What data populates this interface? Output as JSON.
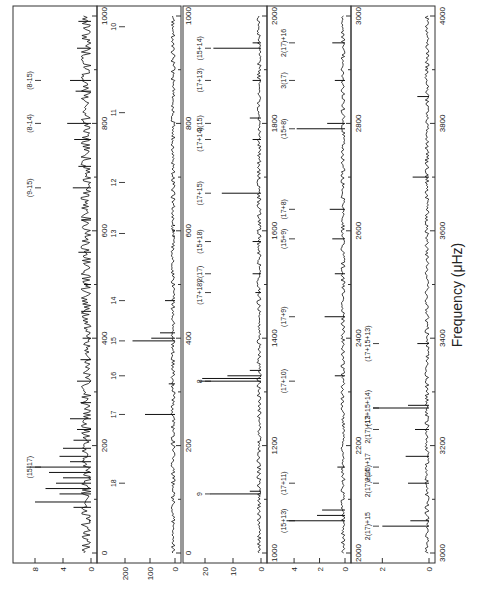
{
  "chart_data": {
    "type": "line",
    "orientation": "rotated-90-ccw",
    "xlabel": "Frequency (μHz)",
    "panels": [
      {
        "id": "p1",
        "xlim": [
          0,
          1000
        ],
        "xticks": [
          0,
          200,
          400,
          600,
          800,
          1000
        ],
        "ylim": [
          0,
          10
        ],
        "yticks": [
          0,
          4,
          8
        ],
        "peaks": [
          {
            "x": 60,
            "y": 0.3
          },
          {
            "x": 85,
            "y": 2.5
          },
          {
            "x": 95,
            "y": 8.0
          },
          {
            "x": 110,
            "y": 4.5
          },
          {
            "x": 120,
            "y": 6.5
          },
          {
            "x": 130,
            "y": 5.0
          },
          {
            "x": 140,
            "y": 4.0
          },
          {
            "x": 150,
            "y": 6.0
          },
          {
            "x": 160,
            "y": 9.2
          },
          {
            "x": 170,
            "y": 3.0
          },
          {
            "x": 180,
            "y": 4.5
          },
          {
            "x": 195,
            "y": 4.0
          },
          {
            "x": 210,
            "y": 2.5
          },
          {
            "x": 230,
            "y": 2.0
          },
          {
            "x": 250,
            "y": 3.0
          },
          {
            "x": 280,
            "y": 1.5
          },
          {
            "x": 320,
            "y": 2.0
          },
          {
            "x": 360,
            "y": 1.5
          },
          {
            "x": 400,
            "y": 1.2
          },
          {
            "x": 450,
            "y": 1.4
          },
          {
            "x": 500,
            "y": 1.0
          },
          {
            "x": 560,
            "y": 1.8
          },
          {
            "x": 620,
            "y": 1.4
          },
          {
            "x": 680,
            "y": 2.6
          },
          {
            "x": 720,
            "y": 1.8
          },
          {
            "x": 770,
            "y": 2.4
          },
          {
            "x": 800,
            "y": 3.4
          },
          {
            "x": 860,
            "y": 2.2
          },
          {
            "x": 880,
            "y": 3.0
          },
          {
            "x": 940,
            "y": 2.0
          },
          {
            "x": 990,
            "y": 1.8
          }
        ],
        "annotations": [
          {
            "label": "(15-17)",
            "x": 160,
            "style": "side"
          },
          {
            "label": "(9-15)",
            "x": 680
          },
          {
            "label": "(8-14)",
            "x": 800
          },
          {
            "label": "(8-15)",
            "x": 880
          }
        ]
      },
      {
        "id": "p2",
        "xlim": [
          0,
          1000
        ],
        "xticks": [
          0,
          200,
          400,
          600,
          800,
          1000
        ],
        "ylim": [
          0,
          280
        ],
        "yticks": [
          0,
          100,
          200
        ],
        "peaks": [
          {
            "x": 258,
            "y": 120
          },
          {
            "x": 315,
            "y": 25
          },
          {
            "x": 395,
            "y": 170
          },
          {
            "x": 400,
            "y": 95
          },
          {
            "x": 410,
            "y": 60
          },
          {
            "x": 470,
            "y": 40
          },
          {
            "x": 590,
            "y": 10
          },
          {
            "x": 600,
            "y": 12
          },
          {
            "x": 610,
            "y": 8
          }
        ],
        "annotations": [
          {
            "label": "18",
            "x": 130
          },
          {
            "label": "17",
            "x": 258
          },
          {
            "label": "16",
            "x": 330
          },
          {
            "label": "15",
            "x": 395
          },
          {
            "label": "14",
            "x": 470
          },
          {
            "label": "13",
            "x": 595
          },
          {
            "label": "12",
            "x": 690
          },
          {
            "label": "11",
            "x": 820
          },
          {
            "label": "10",
            "x": 980
          }
        ]
      },
      {
        "id": "p3",
        "xlim": [
          1000,
          2000
        ],
        "xticks": [
          1000,
          1200,
          1400,
          1600,
          1800,
          2000
        ],
        "ylim": [
          0,
          25
        ],
        "yticks": [
          0,
          10,
          20
        ],
        "peaks": [
          {
            "x": 1110,
            "y": 18
          },
          {
            "x": 1115,
            "y": 4
          },
          {
            "x": 1320,
            "y": 22
          },
          {
            "x": 1325,
            "y": 21
          },
          {
            "x": 1330,
            "y": 12
          },
          {
            "x": 1340,
            "y": 4
          },
          {
            "x": 1485,
            "y": 2
          },
          {
            "x": 1520,
            "y": 3
          },
          {
            "x": 1580,
            "y": 3
          },
          {
            "x": 1670,
            "y": 14
          },
          {
            "x": 1770,
            "y": 3
          },
          {
            "x": 1810,
            "y": 4
          },
          {
            "x": 1880,
            "y": 3
          },
          {
            "x": 1940,
            "y": 17
          },
          {
            "x": 1950,
            "y": 3
          }
        ],
        "annotations": [
          {
            "label": "9",
            "x": 1110
          },
          {
            "label": "8",
            "x": 1320
          },
          {
            "label": "(17+18)",
            "x": 1485
          },
          {
            "label": "2(17)",
            "x": 1520
          },
          {
            "label": "(15+18)",
            "x": 1580
          },
          {
            "label": "(17+15)",
            "x": 1670
          },
          {
            "label": "(17+14)",
            "x": 1770
          },
          {
            "label": "2(15)",
            "x": 1800
          },
          {
            "label": "(17+13)",
            "x": 1880
          },
          {
            "label": "(15+14)",
            "x": 1940
          }
        ]
      },
      {
        "id": "p4",
        "xlim": [
          2000,
          3000
        ],
        "xticks": [
          2000,
          2200,
          2400,
          2600,
          2800,
          3000
        ],
        "ylim": [
          0,
          5.5
        ],
        "yticks": [
          0,
          2,
          4
        ],
        "peaks": [
          {
            "x": 2060,
            "y": 4.6
          },
          {
            "x": 2070,
            "y": 2.2
          },
          {
            "x": 2080,
            "y": 1.8
          },
          {
            "x": 2160,
            "y": 0.6
          },
          {
            "x": 2330,
            "y": 0.8
          },
          {
            "x": 2440,
            "y": 1.6
          },
          {
            "x": 2520,
            "y": 0.8
          },
          {
            "x": 2585,
            "y": 1.0
          },
          {
            "x": 2640,
            "y": 1.2
          },
          {
            "x": 2790,
            "y": 3.8
          },
          {
            "x": 2800,
            "y": 1.4
          },
          {
            "x": 2880,
            "y": 0.8
          },
          {
            "x": 2950,
            "y": 1.0
          }
        ],
        "annotations": [
          {
            "label": "(15+13)",
            "x": 2060
          },
          {
            "label": "(17+11)",
            "x": 2130
          },
          {
            "label": "(17+10)",
            "x": 2320
          },
          {
            "label": "(17+9)",
            "x": 2440
          },
          {
            "label": "(15+9)",
            "x": 2585
          },
          {
            "label": "(17+8)",
            "x": 2640
          },
          {
            "label": "(15+8)",
            "x": 2790
          },
          {
            "label": "3(17)",
            "x": 2880
          },
          {
            "label": "2(17)+16",
            "x": 2950
          }
        ]
      },
      {
        "id": "p5",
        "xlim": [
          3000,
          4000
        ],
        "xticks": [
          3000,
          3200,
          3400,
          3600,
          3800,
          4000
        ],
        "ylim": [
          0,
          3
        ],
        "yticks": [
          0,
          2
        ],
        "peaks": [
          {
            "x": 3050,
            "y": 2.0
          },
          {
            "x": 3060,
            "y": 0.8
          },
          {
            "x": 3130,
            "y": 0.9
          },
          {
            "x": 3180,
            "y": 1.0
          },
          {
            "x": 3230,
            "y": 0.6
          },
          {
            "x": 3270,
            "y": 2.4
          },
          {
            "x": 3275,
            "y": 0.9
          },
          {
            "x": 3390,
            "y": 0.5
          },
          {
            "x": 3700,
            "y": 0.7
          },
          {
            "x": 3850,
            "y": 0.5
          }
        ],
        "annotations": [
          {
            "label": "2(17)+15",
            "x": 3050
          },
          {
            "label": "2(17)+14",
            "x": 3130
          },
          {
            "label": "2(15)+17",
            "x": 3160
          },
          {
            "label": "2(17)+13",
            "x": 3230
          },
          {
            "label": "(17+15+14)",
            "x": 3270
          },
          {
            "label": "(17+15+13)",
            "x": 3390
          }
        ]
      },
      {
        "id": "p6",
        "xlim": [
          4000,
          5000
        ],
        "xticks": [
          4000,
          4200,
          4400,
          4600,
          4800,
          5000
        ],
        "ylim": [
          0,
          3
        ],
        "yticks": [
          0,
          2
        ],
        "peaks": [
          {
            "x": 4630,
            "y": 0.8
          },
          {
            "x": 4790,
            "y": 0.6
          }
        ],
        "annotations": [
          {
            "label": "2(8)",
            "x": 4630
          },
          {
            "label": "(17+15+9)",
            "x": 4790
          }
        ]
      }
    ]
  }
}
